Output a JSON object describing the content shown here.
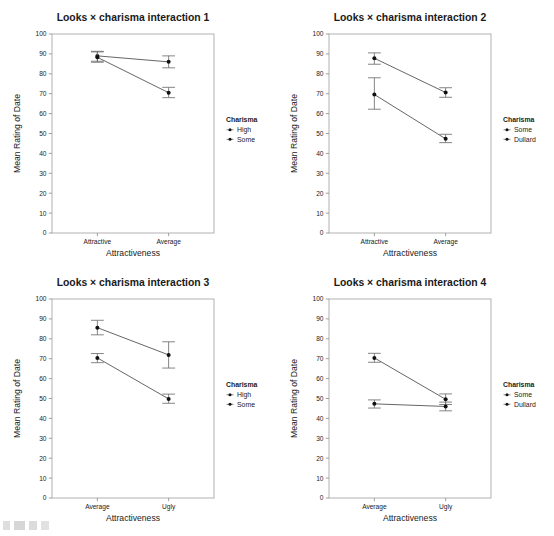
{
  "figure": {
    "width": 554,
    "height": 536,
    "panel_count": 4,
    "background": "#ffffff",
    "ink_color": "#1a1a1a",
    "marker_color": "#111111",
    "line_color": "#4a4a4a",
    "errorbar_color": "#6f6f6f",
    "frame_color": "#a9a9a9",
    "bottom_edge_artifact": "cut-off illegible text fragment"
  },
  "chart_data": [
    {
      "type": "line",
      "panel": 1,
      "title": "Looks × charisma interaction 1",
      "xlabel": "Attractiveness",
      "ylabel": "Mean Rating of Date",
      "categories": [
        "Attractive",
        "Average"
      ],
      "ylim": [
        0,
        100
      ],
      "yticks": [
        0,
        10,
        20,
        30,
        40,
        50,
        60,
        70,
        80,
        90,
        100
      ],
      "grid": false,
      "legend_title": "Charisma",
      "legend_position": "right",
      "series": [
        {
          "name": "High",
          "values": [
            89.0,
            86.0
          ],
          "err_low": [
            86.3,
            83.0
          ],
          "err_high": [
            91.3,
            89.0
          ]
        },
        {
          "name": "Some",
          "values": [
            88.3,
            70.5
          ],
          "err_low": [
            85.8,
            68.0
          ],
          "err_high": [
            91.0,
            73.2
          ]
        }
      ]
    },
    {
      "type": "line",
      "panel": 2,
      "title": "Looks × charisma interaction 2",
      "xlabel": "Attractiveness",
      "ylabel": "Mean Rating of Date",
      "categories": [
        "Attractive",
        "Average"
      ],
      "ylim": [
        0,
        100
      ],
      "yticks": [
        0,
        10,
        20,
        30,
        40,
        50,
        60,
        70,
        80,
        90,
        100
      ],
      "grid": false,
      "legend_title": "Charisma",
      "legend_position": "right",
      "series": [
        {
          "name": "Some",
          "values": [
            87.8,
            70.6
          ],
          "err_low": [
            84.8,
            68.2
          ],
          "err_high": [
            90.5,
            73.0
          ]
        },
        {
          "name": "Dullard",
          "values": [
            69.6,
            47.3
          ],
          "err_low": [
            62.2,
            45.4
          ],
          "err_high": [
            78.0,
            49.6
          ]
        }
      ]
    },
    {
      "type": "line",
      "panel": 3,
      "title": "Looks × charisma interaction 3",
      "xlabel": "Attractiveness",
      "ylabel": "Mean Rating of Date",
      "categories": [
        "Average",
        "Ugly"
      ],
      "ylim": [
        0,
        100
      ],
      "yticks": [
        0,
        10,
        20,
        30,
        40,
        50,
        60,
        70,
        80,
        90,
        100
      ],
      "grid": false,
      "legend_title": "Charisma",
      "legend_position": "right",
      "series": [
        {
          "name": "High",
          "values": [
            85.6,
            71.9
          ],
          "err_low": [
            82.0,
            65.3
          ],
          "err_high": [
            89.3,
            78.5
          ]
        },
        {
          "name": "Some",
          "values": [
            70.4,
            49.8
          ],
          "err_low": [
            68.0,
            47.6
          ],
          "err_high": [
            72.6,
            52.2
          ]
        }
      ]
    },
    {
      "type": "line",
      "panel": 4,
      "title": "Looks × charisma interaction 4",
      "xlabel": "Attractiveness",
      "ylabel": "Mean Rating of Date",
      "categories": [
        "Average",
        "Ugly"
      ],
      "ylim": [
        0,
        100
      ],
      "yticks": [
        0,
        10,
        20,
        30,
        40,
        50,
        60,
        70,
        80,
        90,
        100
      ],
      "grid": false,
      "legend_title": "Charisma",
      "legend_position": "right",
      "series": [
        {
          "name": "Some",
          "values": [
            70.4,
            49.6
          ],
          "err_low": [
            68.2,
            47.0
          ],
          "err_high": [
            72.7,
            52.3
          ]
        },
        {
          "name": "Dullard",
          "values": [
            47.3,
            46.0
          ],
          "err_low": [
            45.2,
            43.8
          ],
          "err_high": [
            49.3,
            48.2
          ]
        }
      ]
    }
  ]
}
